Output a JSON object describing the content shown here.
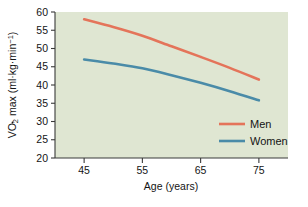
{
  "chart_data": {
    "type": "line",
    "title": "",
    "xlabel": "Age (years)",
    "ylabel": "VO2 max (ml·kg·min⁻¹)",
    "ylabel_parts": {
      "prefix": "V",
      "sub": "O",
      "subscript": "2",
      "mid": " max (ml·kg·min",
      "superscript": "−1",
      "suffix": ")"
    },
    "x": [
      45,
      55,
      65,
      75
    ],
    "xtick_labels": [
      "45",
      "55",
      "65",
      "75"
    ],
    "ytick_labels": [
      "20",
      "25",
      "30",
      "35",
      "40",
      "45",
      "50",
      "55",
      "60"
    ],
    "yticks": [
      20,
      25,
      30,
      35,
      40,
      45,
      50,
      55,
      60
    ],
    "xlim": [
      40,
      80
    ],
    "ylim": [
      20,
      60
    ],
    "grid": false,
    "legend_position": "inside-bottom-right",
    "series": [
      {
        "name": "Men",
        "color": "#e4745a",
        "x": [
          45,
          50,
          55,
          60,
          65,
          70,
          75
        ],
        "values": [
          58.0,
          55.9,
          53.5,
          50.6,
          47.7,
          44.7,
          41.5
        ]
      },
      {
        "name": "Women",
        "color": "#4a8ba8",
        "x": [
          45,
          50,
          55,
          60,
          65,
          70,
          75
        ],
        "values": [
          47.0,
          45.9,
          44.6,
          42.7,
          40.6,
          38.3,
          35.8
        ]
      }
    ]
  },
  "legend": {
    "items": [
      {
        "label": "Men",
        "color": "#e4745a"
      },
      {
        "label": "Women",
        "color": "#4a8ba8"
      }
    ]
  },
  "colors": {
    "plot_background": "#dfe6d2",
    "page_background": "#ffffff",
    "axis": "#3a3a3a",
    "men": "#e4745a",
    "women": "#4a8ba8"
  }
}
